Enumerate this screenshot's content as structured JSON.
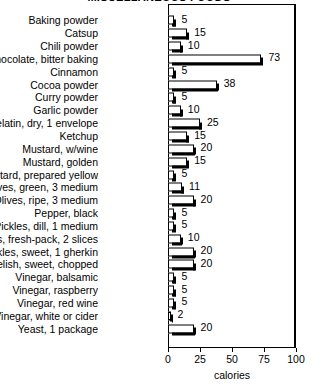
{
  "chart_data": {
    "type": "bar",
    "orientation": "horizontal",
    "title": "MISCELLANEOUS FOODS",
    "xlabel": "calories",
    "ylabel": "",
    "xlim": [
      0,
      100
    ],
    "xticks": [
      0,
      25,
      50,
      75,
      100
    ],
    "xtick_labels": [
      "0",
      "25",
      "50",
      "75",
      "100"
    ],
    "grid": false,
    "legend": false,
    "categories": [
      "Baking powder",
      "Catsup",
      "Chili powder",
      "Chocolate, bitter baking",
      "Cinnamon",
      "Cocoa powder",
      "Curry powder",
      "Garlic powder",
      "Gelatin, dry, 1 envelope",
      "Ketchup",
      "Mustard, w/wine",
      "Mustard, golden",
      "Mustard, prepared yellow",
      "Olives, green, 3 medium",
      "Olives, ripe, 3 medium",
      "Pepper, black",
      "Pickles, dill, 1 medium",
      "Pickles, fresh-pack, 2 slices",
      "Pickles, sweet, 1 gherkin",
      "Relish, sweet, chopped",
      "Vinegar, balsamic",
      "Vinegar, raspberry",
      "Vinegar, red wine",
      "Vinegar, white or cider",
      "Yeast, 1 package"
    ],
    "values": [
      5,
      15,
      10,
      73,
      5,
      38,
      5,
      10,
      25,
      15,
      20,
      15,
      5,
      11,
      20,
      5,
      5,
      10,
      20,
      20,
      5,
      5,
      5,
      2,
      20
    ],
    "value_labels": [
      "5",
      "15",
      "10",
      "73",
      "5",
      "38",
      "5",
      "10",
      "25",
      "15",
      "20",
      "15",
      "5",
      "11",
      "20",
      "5",
      "5",
      "10",
      "20",
      "20",
      "5",
      "5",
      "5",
      "2",
      "20"
    ]
  },
  "colors": {
    "bar_fill": "#ffffff",
    "bar_outline": "#000000",
    "bar_shadow": "#000000",
    "background": "#ffffff",
    "text": "#000000"
  }
}
